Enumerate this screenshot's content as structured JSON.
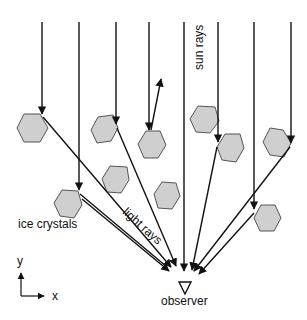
{
  "diagram": {
    "labels": {
      "sun_rays": "sun rays",
      "ice_crystals": "ice crystals",
      "light_rays": "light rays",
      "observer": "observer",
      "axis_y": "y",
      "axis_x": "x"
    },
    "colors": {
      "crystal_fill": "#cfcfcf",
      "crystal_stroke": "#555555",
      "ray": "#111111"
    }
  }
}
